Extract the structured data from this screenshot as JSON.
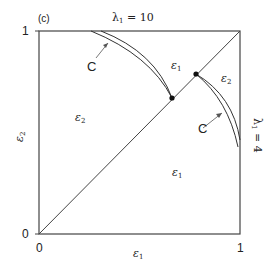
{
  "panel_label": "(c)",
  "top_label": {
    "symbol": "λ",
    "sub": "1",
    "rest": " = 10"
  },
  "right_label": {
    "symbol": "λ",
    "sub": "1",
    "rest": " = 4"
  },
  "axes": {
    "x_label": {
      "symbol": "ε",
      "sub": "1"
    },
    "y_label": {
      "symbol": "ε",
      "sub": "2"
    },
    "x_ticks": [
      "0",
      "1"
    ],
    "y_ticks": [
      "0",
      "1"
    ]
  },
  "regions": [
    {
      "symbol": "ε",
      "sub": "2",
      "position": "left"
    },
    {
      "symbol": "ε",
      "sub": "1",
      "position": "upper-middle"
    },
    {
      "symbol": "ε",
      "sub": "2",
      "position": "right"
    },
    {
      "symbol": "ε",
      "sub": "1",
      "position": "lower-right"
    }
  ],
  "curve_labels": [
    "C",
    "C"
  ],
  "colors": {
    "line": "#333333",
    "text": "#222222",
    "background": "#ffffff"
  }
}
